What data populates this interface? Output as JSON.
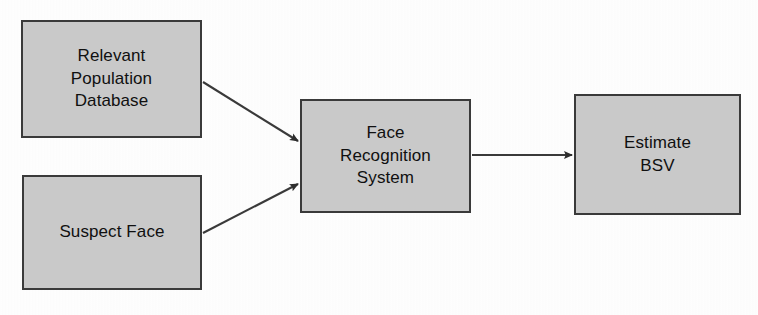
{
  "diagram": {
    "background_color": "#ffffff",
    "node_fill_color": "#c9c9c9",
    "node_border_color": "#3a3a3a",
    "text_color": "#101010",
    "connector_color": "#3a3a3a",
    "nodes": [
      {
        "id": "relevant-population-database",
        "label": "Relevant\nPopulation\nDatabase",
        "line1": "Relevant",
        "line2": "Population",
        "line3": "Database"
      },
      {
        "id": "suspect-face",
        "label": "Suspect Face",
        "line1": "Suspect Face",
        "line2": "",
        "line3": ""
      },
      {
        "id": "face-recognition-system",
        "label": "Face\nRecognition\nSystem",
        "line1": "Face",
        "line2": "Recognition",
        "line3": "System"
      },
      {
        "id": "estimate-bsv",
        "label": "Estimate\nBSV",
        "line1": "Estimate",
        "line2": "BSV",
        "line3": ""
      }
    ],
    "connectors": [
      {
        "id": "database-to-system",
        "from": "relevant-population-database",
        "to": "face-recognition-system",
        "style": "solid-arrow",
        "direction": "diagonal-down-right"
      },
      {
        "id": "suspect-to-system",
        "from": "suspect-face",
        "to": "face-recognition-system",
        "style": "solid-arrow",
        "direction": "diagonal-up-right"
      },
      {
        "id": "system-to-estimate",
        "from": "face-recognition-system",
        "to": "estimate-bsv",
        "style": "solid-arrow",
        "direction": "horizontal-right"
      }
    ]
  }
}
